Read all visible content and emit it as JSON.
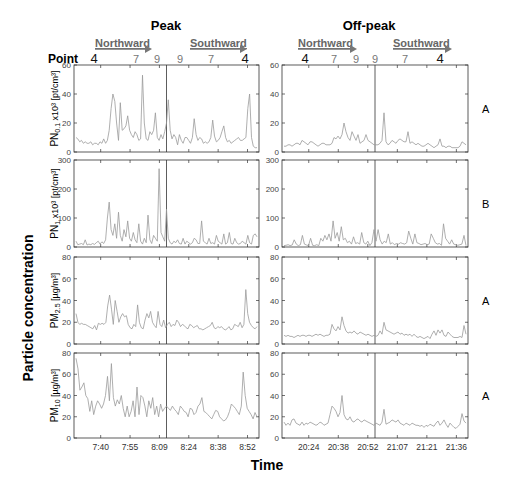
{
  "chart_data": {
    "type": "line",
    "title_left": "Peak",
    "title_right": "Off-peak",
    "ylabel_global": "Particle concentration",
    "xlabel_global": "Time",
    "direction_labels": {
      "north": "Northward",
      "south": "Southward"
    },
    "point_label": "Point",
    "points_left": [
      "4",
      "7",
      "9",
      "9",
      "7",
      "4"
    ],
    "points_right": [
      "4",
      "7",
      "9",
      "9",
      "7",
      "4"
    ],
    "x_ticks_left": [
      "7:40",
      "7:55",
      "8:09",
      "8:24",
      "8:38",
      "8:52"
    ],
    "x_ticks_right": [
      "20:24",
      "20:38",
      "20:52",
      "21:07",
      "21:21",
      "21:36"
    ],
    "line_color": "#9a9a9a",
    "panels": [
      {
        "name": "PN0.1",
        "ylabel_main": "PN",
        "ylabel_sub": "0.1",
        "ylabel_unit": " x10³ [pt/cm³]",
        "ylim": [
          0,
          60
        ],
        "yticks": [
          0,
          20,
          40,
          60
        ],
        "significance": "A",
        "peak": [
          10,
          9,
          7,
          8,
          6,
          7,
          6,
          6,
          7,
          5,
          6,
          6,
          5,
          7,
          6,
          9,
          6,
          8,
          15,
          30,
          40,
          35,
          20,
          8,
          34,
          15,
          16,
          18,
          25,
          15,
          12,
          10,
          14,
          12,
          8,
          9,
          53,
          20,
          9,
          8,
          14,
          12,
          15,
          27,
          10,
          8,
          12,
          9,
          14,
          20,
          36,
          15,
          9,
          12,
          10,
          5,
          12,
          8,
          6,
          10,
          10,
          8,
          6,
          10,
          23,
          12,
          8,
          10,
          9,
          6,
          7,
          6,
          7,
          10,
          22,
          11,
          7,
          8,
          10,
          14,
          18,
          10,
          7,
          8,
          6,
          7,
          8,
          9,
          10,
          8,
          8,
          9,
          10,
          30,
          40,
          10,
          4,
          3,
          3
        ],
        "offpeak": [
          4,
          4,
          5,
          5,
          4,
          5,
          6,
          6,
          5,
          8,
          7,
          6,
          5,
          7,
          7,
          6,
          5,
          4,
          5,
          6,
          6,
          5,
          5,
          5,
          6,
          10,
          9,
          11,
          9,
          12,
          20,
          14,
          10,
          8,
          14,
          11,
          8,
          12,
          6,
          7,
          8,
          12,
          8,
          7,
          6,
          5,
          5,
          5,
          6,
          8,
          27,
          7,
          5,
          6,
          8,
          7,
          6,
          8,
          9,
          8,
          7,
          7,
          14,
          6,
          7,
          6,
          5,
          6,
          5,
          4,
          4,
          5,
          6,
          5,
          4,
          3,
          4,
          5,
          9,
          4,
          4,
          3,
          4,
          4,
          3,
          3,
          3,
          3,
          4,
          7,
          6,
          5
        ]
      },
      {
        "name": "PN1",
        "ylabel_main": "PN",
        "ylabel_sub": "1",
        "ylabel_unit": " x10³ [pt/cm³]",
        "ylim": [
          0,
          300
        ],
        "yticks": [
          0,
          100,
          200,
          300
        ],
        "significance": "B",
        "peak": [
          20,
          8,
          10,
          12,
          8,
          25,
          7,
          10,
          8,
          12,
          9,
          15,
          20,
          10,
          18,
          12,
          25,
          100,
          155,
          60,
          40,
          80,
          30,
          120,
          40,
          20,
          60,
          35,
          90,
          30,
          20,
          50,
          25,
          15,
          80,
          20,
          10,
          30,
          15,
          110,
          25,
          12,
          40,
          30,
          20,
          270,
          50,
          35,
          20,
          130,
          30,
          15,
          10,
          20,
          15,
          25,
          12,
          10,
          30,
          10,
          20,
          15,
          10,
          15,
          30,
          25,
          12,
          12,
          90,
          20,
          15,
          10,
          30,
          12,
          15,
          10,
          40,
          20,
          15,
          10,
          45,
          10,
          15,
          50,
          12,
          10,
          30,
          15,
          10,
          12,
          20,
          15,
          10,
          40,
          15,
          10,
          40,
          45,
          35
        ],
        "offpeak": [
          5,
          6,
          8,
          5,
          7,
          25,
          10,
          5,
          8,
          40,
          10,
          7,
          5,
          30,
          6,
          5,
          8,
          5,
          30,
          20,
          40,
          25,
          45,
          20,
          90,
          30,
          50,
          20,
          70,
          25,
          30,
          15,
          20,
          10,
          35,
          12,
          15,
          10,
          50,
          15,
          10,
          20,
          5,
          15,
          60,
          20,
          60,
          25,
          10,
          20,
          15,
          45,
          10,
          15,
          8,
          12,
          10,
          15,
          12,
          10,
          15,
          55,
          30,
          10,
          45,
          15,
          12,
          8,
          10,
          12,
          8,
          10,
          45,
          30,
          15,
          10,
          12,
          6,
          80,
          30,
          20,
          10,
          25,
          10,
          8,
          6,
          8,
          10,
          40,
          5
        ]
      },
      {
        "name": "PM2.5",
        "ylabel_main": "PM",
        "ylabel_sub": "2.5",
        "ylabel_unit": "  [µg/m³]",
        "ylim": [
          0,
          80
        ],
        "yticks": [
          0,
          20,
          40,
          60,
          80
        ],
        "significance": "A",
        "peak": [
          28,
          20,
          18,
          19,
          18,
          18,
          17,
          16,
          15,
          14,
          17,
          13,
          19,
          18,
          19,
          18,
          20,
          35,
          45,
          32,
          18,
          40,
          30,
          20,
          25,
          28,
          25,
          26,
          18,
          15,
          14,
          18,
          16,
          36,
          20,
          15,
          14,
          22,
          28,
          24,
          30,
          20,
          17,
          15,
          30,
          18,
          16,
          22,
          15,
          18,
          20,
          16,
          18,
          17,
          22,
          20,
          16,
          18,
          17,
          15,
          14,
          18,
          17,
          15,
          16,
          17,
          14,
          14,
          13,
          14,
          15,
          16,
          17,
          20,
          15,
          14,
          16,
          15,
          16,
          14,
          13,
          14,
          16,
          13,
          14,
          18,
          17,
          16,
          20,
          15,
          18,
          50,
          28,
          20,
          17,
          15,
          14,
          16
        ],
        "offpeak": [
          8,
          7,
          8,
          7,
          7,
          6,
          7,
          8,
          7,
          8,
          8,
          7,
          8,
          8,
          7,
          8,
          9,
          8,
          9,
          8,
          7,
          8,
          8,
          9,
          18,
          14,
          12,
          16,
          13,
          25,
          17,
          12,
          10,
          11,
          10,
          12,
          10,
          9,
          11,
          10,
          9,
          8,
          9,
          8,
          7,
          8,
          7,
          8,
          12,
          9,
          20,
          13,
          12,
          11,
          10,
          9,
          10,
          11,
          9,
          10,
          8,
          9,
          8,
          9,
          7,
          9,
          7,
          6,
          7,
          6,
          5,
          6,
          7,
          5,
          9,
          12,
          8,
          13,
          10,
          13,
          8,
          7,
          11,
          9,
          7,
          6,
          6,
          6,
          7,
          6,
          17,
          9
        ]
      },
      {
        "name": "PM10",
        "ylabel_main": "PM",
        "ylabel_sub": "10",
        "ylabel_unit": "  [µg/m³]",
        "ylim": [
          0,
          80
        ],
        "yticks": [
          0,
          20,
          40,
          60,
          80
        ],
        "significance": "A",
        "peak": [
          75,
          65,
          45,
          48,
          52,
          40,
          37,
          25,
          35,
          22,
          30,
          35,
          32,
          28,
          32,
          40,
          58,
          35,
          70,
          38,
          30,
          36,
          32,
          40,
          28,
          20,
          30,
          20,
          25,
          35,
          20,
          48,
          22,
          40,
          38,
          30,
          20,
          35,
          28,
          38,
          22,
          30,
          20,
          32,
          25,
          28,
          30,
          28,
          26,
          30,
          27,
          25,
          22,
          30,
          28,
          25,
          24,
          20,
          28,
          27,
          22,
          24,
          30,
          32,
          38,
          25,
          24,
          22,
          20,
          18,
          22,
          26,
          25,
          20,
          18,
          16,
          17,
          20,
          25,
          32,
          30,
          28,
          25,
          22,
          30,
          62,
          40,
          28,
          25,
          22,
          18,
          24,
          20
        ],
        "offpeak": [
          15,
          12,
          14,
          12,
          17,
          18,
          14,
          13,
          12,
          15,
          12,
          14,
          13,
          15,
          14,
          13,
          12,
          13,
          15,
          14,
          12,
          13,
          14,
          22,
          30,
          28,
          25,
          20,
          24,
          40,
          22,
          18,
          17,
          20,
          16,
          15,
          17,
          18,
          16,
          15,
          17,
          16,
          15,
          14,
          13,
          12,
          14,
          13,
          12,
          15,
          27,
          13,
          14,
          15,
          17,
          16,
          15,
          17,
          14,
          13,
          12,
          14,
          13,
          12,
          14,
          13,
          12,
          12,
          11,
          12,
          10,
          12,
          11,
          13,
          12,
          11,
          14,
          16,
          12,
          14,
          17,
          13,
          10,
          14,
          12,
          10,
          9,
          11,
          13,
          23,
          16,
          14
        ]
      }
    ]
  }
}
